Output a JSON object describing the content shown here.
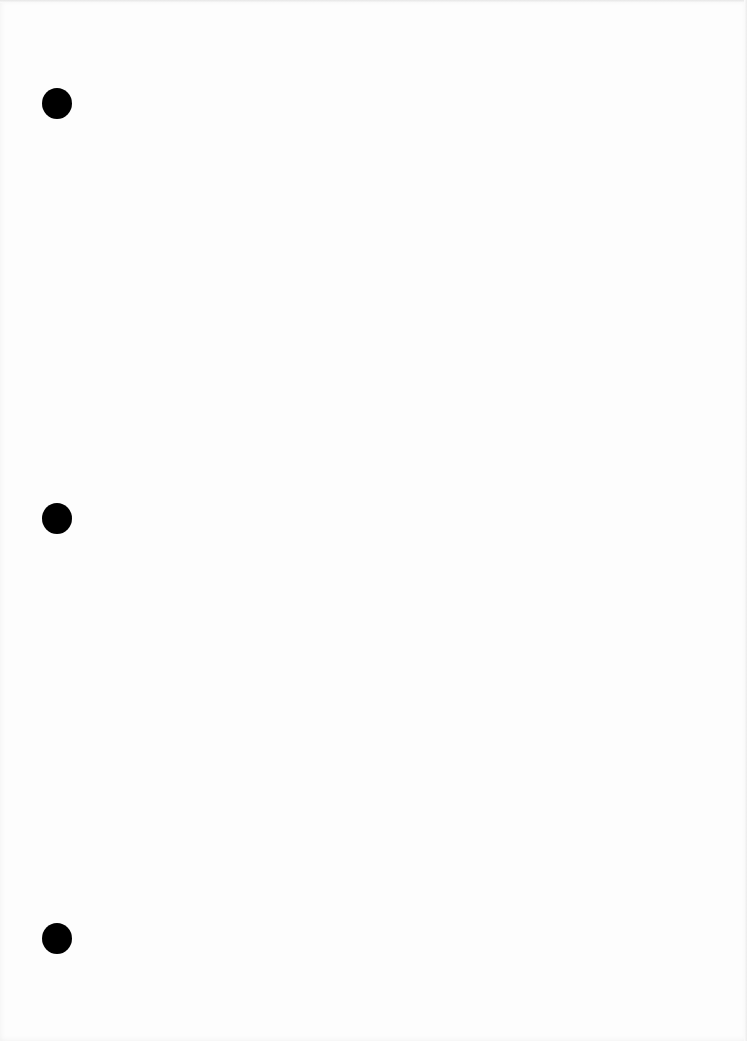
{
  "document": {
    "type": "scanned-blank-page",
    "background_color": "#fdfdfd",
    "punch_holes": [
      {
        "cx": 57,
        "cy": 103,
        "diameter": 30,
        "color": "#000000"
      },
      {
        "cx": 57,
        "cy": 518,
        "diameter": 30,
        "color": "#000000"
      },
      {
        "cx": 57,
        "cy": 938,
        "diameter": 30,
        "color": "#000000"
      }
    ],
    "text_content": ""
  }
}
